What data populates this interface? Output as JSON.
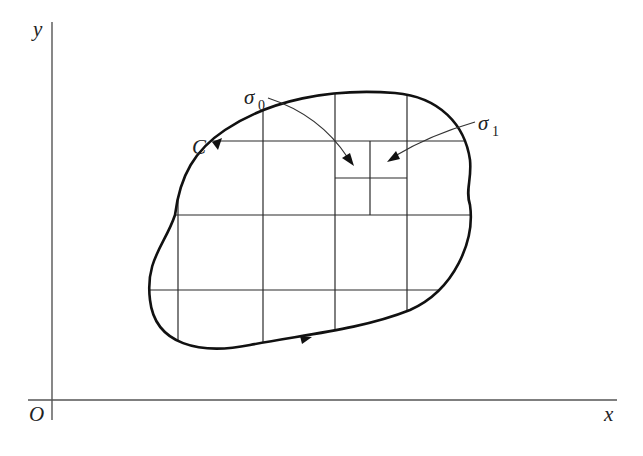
{
  "figure": {
    "axes": {
      "y_label": "y",
      "x_label": "x",
      "origin_label": "O"
    },
    "curve": {
      "label": "C",
      "orientation": "counterclockwise"
    },
    "annotations": [
      {
        "symbol": "σ",
        "subscript": "0",
        "target": "upper-left small subcell"
      },
      {
        "symbol": "σ",
        "subscript": "1",
        "target": "upper-right small subcell"
      }
    ],
    "grid": {
      "vertical_lines_x": [
        178,
        263,
        335,
        370,
        407
      ],
      "horizontal_lines_y": [
        141,
        178,
        215,
        290
      ]
    },
    "colors": {
      "background": "#ffffff",
      "curve": "#111111",
      "grid": "#2a2a2a",
      "axis": "#555555"
    }
  }
}
